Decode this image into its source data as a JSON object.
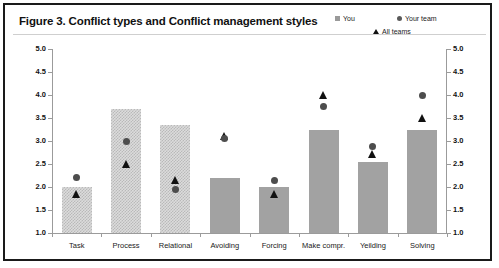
{
  "figure": {
    "title": "Figure 3. Conflict types and Conflict management styles"
  },
  "legend": {
    "position": "top-right",
    "items": [
      {
        "label": "You",
        "marker": "square-swatch-icon",
        "color": "#9a9a9a"
      },
      {
        "label": "Your team",
        "marker": "circle-swatch-icon",
        "color": "#595959"
      },
      {
        "label": "All teams",
        "marker": "triangle-swatch-icon",
        "color": "#111111"
      }
    ]
  },
  "axes": {
    "y_left_ticks": [
      "5.0",
      "4.5",
      "4.0",
      "3.5",
      "3.0",
      "2.5",
      "2.0",
      "1.5",
      "1.0"
    ],
    "y_right_ticks": [
      "5.0",
      "4.5",
      "4.0",
      "3.5",
      "3.0",
      "2.5",
      "2.0",
      "1.5",
      "1.0"
    ]
  },
  "chart_data": {
    "type": "bar",
    "title": "Figure 3. Conflict types and Conflict management styles",
    "xlabel": "",
    "ylabel": "",
    "ylim": [
      1.0,
      5.0
    ],
    "ytick_step": 0.5,
    "grid": false,
    "legend_position": "top-right",
    "categories": [
      "Task",
      "Process",
      "Relational",
      "Avoiding",
      "Forcing",
      "Make compr.",
      "Yeilding",
      "Solving"
    ],
    "series": [
      {
        "name": "You",
        "type": "bar",
        "values": [
          2.0,
          3.7,
          3.35,
          2.2,
          2.0,
          3.25,
          2.55,
          3.25
        ]
      },
      {
        "name": "Your team",
        "type": "scatter",
        "marker": "circle",
        "values": [
          2.2,
          3.0,
          1.95,
          3.05,
          2.15,
          3.75,
          2.88,
          4.0
        ]
      },
      {
        "name": "All teams",
        "type": "scatter",
        "marker": "triangle",
        "values": [
          1.85,
          2.5,
          2.15,
          3.1,
          1.85,
          4.0,
          2.72,
          3.5
        ]
      }
    ],
    "bar_styles": [
      "hatch",
      "hatch",
      "hatch",
      "solid",
      "solid",
      "solid",
      "solid",
      "solid"
    ]
  }
}
